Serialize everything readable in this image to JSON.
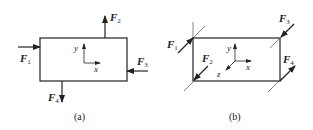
{
  "figures": [
    {
      "caption": "(a)",
      "forces": [
        {
          "name": "F",
          "sub": "1"
        },
        {
          "name": "F",
          "sub": "2"
        },
        {
          "name": "F",
          "sub": "3"
        },
        {
          "name": "F",
          "sub": "4"
        }
      ],
      "axes": {
        "x": "x",
        "y": "y"
      }
    },
    {
      "caption": "(b)",
      "forces": [
        {
          "name": "F",
          "sub": "1"
        },
        {
          "name": "F",
          "sub": "2"
        },
        {
          "name": "F",
          "sub": "3"
        },
        {
          "name": "F",
          "sub": "4"
        }
      ],
      "axes": {
        "x": "x",
        "y": "y",
        "z": "z"
      }
    }
  ],
  "colors": {
    "line": "#222222",
    "thin": "#555555",
    "background": "#ffffff"
  }
}
